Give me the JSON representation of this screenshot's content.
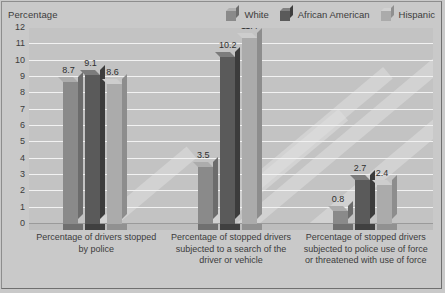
{
  "axis_title": "Percentage",
  "legend": [
    {
      "label": "White",
      "color": "#8a8a8a"
    },
    {
      "label": "African American",
      "color": "#5a5a5a"
    },
    {
      "label": "Hispanic",
      "color": "#ababab"
    }
  ],
  "yticks": [
    "12",
    "11",
    "10",
    "9",
    "8",
    "7",
    "6",
    "5",
    "4",
    "3",
    "2",
    "1",
    "0"
  ],
  "categories": [
    "Percentage of drivers stopped by police",
    "Percentage of stopped drivers subjected to a search of the driver or vehicle",
    "Percentage of stopped drivers subjected to police use of force or threatened with use of force"
  ],
  "values": {
    "g0": [
      "8.7",
      "9.1",
      "8.6"
    ],
    "g1": [
      "3.5",
      "10.2",
      "11.4"
    ],
    "g2": [
      "0.8",
      "2.7",
      "2.4"
    ]
  },
  "chart_data": {
    "type": "bar",
    "title": "",
    "subtitle": "",
    "xlabel": "",
    "ylabel": "Percentage",
    "ylim": [
      0,
      12
    ],
    "ytick_interval": 1,
    "grid": true,
    "legend_position": "top-right",
    "categories": [
      "Percentage of drivers stopped by police",
      "Percentage of stopped drivers subjected to a search of the driver or vehicle",
      "Percentage of stopped drivers subjected to police use of force or threatened with use of force"
    ],
    "series": [
      {
        "name": "White",
        "color": "#8a8a8a",
        "values": [
          8.7,
          3.5,
          0.8
        ]
      },
      {
        "name": "African American",
        "color": "#5a5a5a",
        "values": [
          9.1,
          10.2,
          2.7
        ]
      },
      {
        "name": "Hispanic",
        "color": "#ababab",
        "values": [
          8.6,
          11.4,
          2.4
        ]
      }
    ]
  }
}
